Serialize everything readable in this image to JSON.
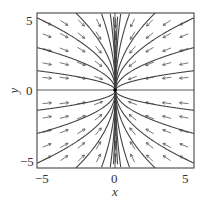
{
  "chart_data": {
    "type": "quiver",
    "title": "",
    "xlabel": "x",
    "ylabel": "y",
    "xlim": [
      -5.5,
      5.5
    ],
    "ylim": [
      -5.5,
      5.5
    ],
    "xticks": [
      "−5",
      "0",
      "5"
    ],
    "yticks": [
      "5",
      "0",
      "−5"
    ],
    "grid": false,
    "field": {
      "dx": "-x",
      "dy": "-y/2"
    },
    "equilibrium": [
      0,
      0
    ],
    "trajectory_constants": [
      -5.5,
      -3.3,
      -2.2,
      -1.3,
      -0.6,
      0.6,
      1.3,
      2.2,
      3.3,
      5.5,
      -9,
      9,
      -14,
      14
    ]
  },
  "axes": {
    "x_label": "x",
    "y_label": "y",
    "x_ticks": {
      "left": "−5",
      "mid": "0",
      "right": "5"
    },
    "y_ticks": {
      "top": "5",
      "mid": "0",
      "bottom": "−5"
    }
  }
}
